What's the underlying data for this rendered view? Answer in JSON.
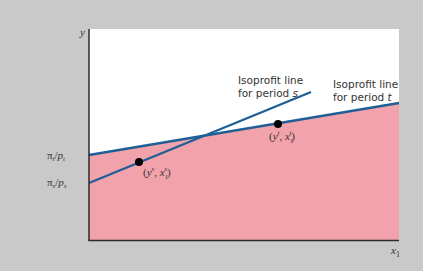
{
  "figure": {
    "axes": {
      "y_label": "y",
      "x_label": "x",
      "x_label_sub": "1"
    },
    "y_intercepts": {
      "t": {
        "pi": "π",
        "pi_sub": "t",
        "p": "p",
        "p_sub": "t"
      },
      "s": {
        "pi": "π",
        "pi_sub": "s",
        "p": "p",
        "p_sub": "s"
      }
    },
    "annotations": {
      "line_s_line1": "Isoprofit line",
      "line_s_line2": "for period ",
      "line_s_period": "s",
      "line_t_line1": "Isoprofit line",
      "line_t_line2": "for period ",
      "line_t_period": "t"
    },
    "points": {
      "s": {
        "open": "(",
        "y": "y",
        "sup_y": "s",
        "sep": ", ",
        "x": "x",
        "sub_x": "1",
        "sup_x": "s",
        "close": ")"
      },
      "t": {
        "open": "(",
        "y": "y",
        "sup_y": "t",
        "sep": ", ",
        "x": "x",
        "sub_x": "1",
        "sup_x": "t",
        "close": ")"
      }
    },
    "colors": {
      "background": "#c9c9c9",
      "panel": "#ffffff",
      "feasible_region": "#f2a2aa",
      "isoprofit_line": "#1f5f96",
      "axis": "#2a2a2a",
      "point": "#000000"
    }
  }
}
